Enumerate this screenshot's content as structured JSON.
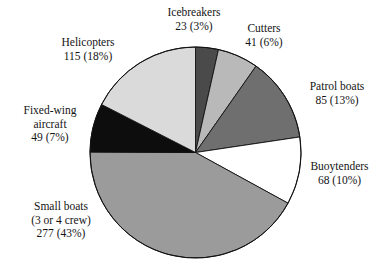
{
  "chart_data": {
    "type": "pie",
    "title": "",
    "subtitle": "",
    "xlabel": "",
    "ylabel": "",
    "total": 658,
    "legend_position": "outside-labels",
    "grid": false,
    "start_angle_deg": 0,
    "direction": "clockwise",
    "categories": [
      "Icebreakers",
      "Cutters",
      "Patrol boats",
      "Buoytenders",
      "Small boats (3 or 4 crew)",
      "Fixed-wing aircraft",
      "Helicopters"
    ],
    "values": [
      23,
      41,
      85,
      68,
      277,
      49,
      115
    ],
    "percents": [
      3,
      6,
      13,
      10,
      43,
      7,
      18
    ],
    "colors": [
      "#4a4a4a",
      "#b9b9b9",
      "#6f6f6f",
      "#ffffff",
      "#9b9b9b",
      "#0d0d0d",
      "#dadada"
    ],
    "slices": [
      {
        "name": "Icebreakers",
        "value": 23,
        "percent": 3,
        "color": "#4a4a4a",
        "label_lines": [
          "Icebreakers",
          "23 (3%)"
        ]
      },
      {
        "name": "Cutters",
        "value": 41,
        "percent": 6,
        "color": "#b9b9b9",
        "label_lines": [
          "Cutters",
          "41 (6%)"
        ]
      },
      {
        "name": "Patrol boats",
        "value": 85,
        "percent": 13,
        "color": "#6f6f6f",
        "label_lines": [
          "Patrol boats",
          "85 (13%)"
        ]
      },
      {
        "name": "Buoytenders",
        "value": 68,
        "percent": 10,
        "color": "#ffffff",
        "label_lines": [
          "Buoytenders",
          "68 (10%)"
        ]
      },
      {
        "name": "Small boats",
        "value": 277,
        "percent": 43,
        "color": "#9b9b9b",
        "label_lines": [
          "Small boats",
          "(3 or 4 crew)",
          "277 (43%)"
        ]
      },
      {
        "name": "Fixed-wing aircraft",
        "value": 49,
        "percent": 7,
        "color": "#0d0d0d",
        "label_lines": [
          "Fixed-wing",
          "aircraft",
          "49 (7%)"
        ]
      },
      {
        "name": "Helicopters",
        "value": 115,
        "percent": 18,
        "color": "#dadada",
        "label_lines": [
          "Helicopters",
          "115 (18%)"
        ]
      }
    ]
  },
  "labels": {
    "icebreakers": {
      "line1": "Icebreakers",
      "line2": "23 (3%)"
    },
    "cutters": {
      "line1": "Cutters",
      "line2": "41 (6%)"
    },
    "patrol_boats": {
      "line1": "Patrol boats",
      "line2": "85 (13%)"
    },
    "buoytenders": {
      "line1": "Buoytenders",
      "line2": "68 (10%)"
    },
    "small_boats": {
      "line1": "Small boats",
      "line2": "(3 or 4 crew)",
      "line3": "277 (43%)"
    },
    "fixed_wing": {
      "line1": "Fixed-wing",
      "line2": "aircraft",
      "line3": "49 (7%)"
    },
    "helicopters": {
      "line1": "Helicopters",
      "line2": "115 (18%)"
    }
  }
}
